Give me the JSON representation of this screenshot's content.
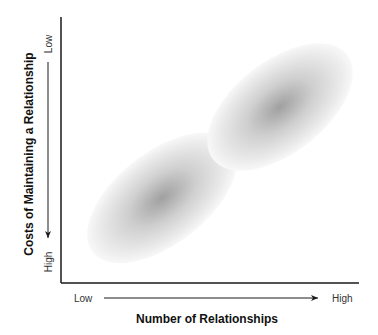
{
  "diagram": {
    "x_axis": {
      "title": "Number of Relationships",
      "low_label": "Low",
      "high_label": "High"
    },
    "y_axis": {
      "title": "Costs of Maintaining a Relationship",
      "low_label": "Low",
      "high_label": "High"
    },
    "regions": [
      {
        "name": "lower-left-cluster",
        "position": "low number, high cost"
      },
      {
        "name": "upper-right-cluster",
        "position": "high number, low cost"
      }
    ],
    "colors": {
      "axis": "#1a1a1a",
      "blob_center": "#9a9a9a",
      "blob_edge": "#f2f2f2"
    }
  }
}
